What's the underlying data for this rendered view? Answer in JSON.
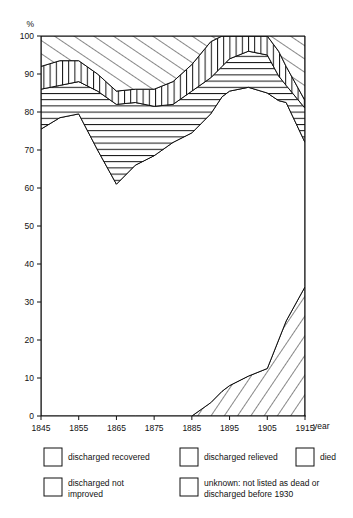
{
  "chart_data": {
    "type": "area",
    "title": "",
    "xlabel": "year",
    "ylabel": "%",
    "ylim": [
      0,
      100
    ],
    "xlim": [
      1845,
      1915
    ],
    "grid": false,
    "legend_position": "bottom",
    "stacked": true,
    "x": [
      1845,
      1850,
      1855,
      1860,
      1865,
      1870,
      1875,
      1880,
      1885,
      1890,
      1893,
      1895,
      1900,
      1905,
      1908,
      1910,
      1915
    ],
    "yticks": [
      0,
      10,
      20,
      30,
      40,
      50,
      60,
      70,
      80,
      90,
      100
    ],
    "xticks": [
      1845,
      1855,
      1865,
      1875,
      1885,
      1895,
      1905,
      1915
    ],
    "series": [
      {
        "name": "unknown: not listed as dead or discharged before 1930",
        "pattern": "diagonal-backslash",
        "order": 1,
        "values": [
          0,
          0,
          0,
          0,
          0,
          0,
          0,
          0,
          0,
          3.5,
          6.5,
          8,
          10.5,
          12.5,
          20,
          25,
          34
        ]
      },
      {
        "name": "died",
        "pattern": "blank",
        "order": 2,
        "values": [
          75.5,
          78.5,
          79.5,
          70,
          61,
          66,
          68.5,
          72,
          74.5,
          76,
          77.5,
          77.5,
          76,
          72.5,
          63,
          57.5,
          38
        ]
      },
      {
        "name": "discharged not improved",
        "pattern": "horizontal",
        "order": 3,
        "values": [
          10.5,
          8.5,
          8.5,
          15.5,
          21,
          16.5,
          13,
          10,
          11,
          9.5,
          8,
          8.5,
          9.5,
          10,
          6.5,
          4.5,
          9
        ]
      },
      {
        "name": "discharged relieved",
        "pattern": "vertical",
        "order": 4,
        "values": [
          6,
          6.5,
          5.5,
          4.5,
          3.5,
          3.5,
          4.5,
          6,
          7,
          9.5,
          10.5,
          11.5,
          11,
          12.5,
          6.5,
          5,
          2
        ]
      },
      {
        "name": "discharged recovered",
        "pattern": "diagonal-slash",
        "order": 5,
        "values": [
          8,
          6.5,
          6.5,
          10,
          14.5,
          14,
          14,
          12,
          7.5,
          5.5,
          4,
          2.5,
          3,
          2.5,
          4,
          8,
          17
        ]
      }
    ],
    "cumulative_boundaries": {
      "unknown_top": [
        0,
        0,
        0,
        0,
        0,
        0,
        0,
        0,
        0,
        3.5,
        6.5,
        8,
        10.5,
        12.5,
        20,
        25,
        34
      ],
      "died_top": [
        75.5,
        78.5,
        79.5,
        70,
        61,
        66,
        68.5,
        72,
        74.5,
        79.5,
        84,
        85.5,
        86.5,
        85,
        83,
        82.5,
        72
      ],
      "notimproved_top": [
        86,
        87,
        88,
        85.5,
        82,
        82.5,
        81.5,
        82,
        85.5,
        89,
        92,
        94,
        96,
        95,
        89.5,
        87,
        81
      ],
      "relieved_top": [
        92,
        93.5,
        93.5,
        90,
        85.5,
        86,
        86,
        88,
        92.5,
        98.5,
        102.5,
        105.5,
        107,
        107.5,
        96,
        92,
        83
      ],
      "recovered_top": [
        100,
        100,
        100,
        100,
        100,
        100,
        100,
        100,
        100,
        100,
        100,
        100,
        100,
        100,
        100,
        100,
        100
      ]
    }
  },
  "axes": {
    "y_axis_unit": "%",
    "x_axis_name": "year",
    "y_tick_labels": [
      "0",
      "10",
      "20",
      "30",
      "40",
      "50",
      "60",
      "70",
      "80",
      "90",
      "100"
    ],
    "x_tick_labels": [
      "1845",
      "1855",
      "1865",
      "1875",
      "1885",
      "1895",
      "1905",
      "1915"
    ]
  },
  "legend": {
    "items": [
      {
        "label": "discharged recovered",
        "pattern": "diagonal-slash"
      },
      {
        "label": "discharged relieved",
        "pattern": "vertical"
      },
      {
        "label": "died",
        "pattern": "blank"
      },
      {
        "label": "discharged not improved",
        "label_line1": "discharged not",
        "label_line2": "improved",
        "pattern": "horizontal"
      },
      {
        "label": "unknown: not listed as dead or discharged before 1930",
        "label_line1": "unknown: not listed as dead or",
        "label_line2": "discharged before 1930",
        "pattern": "diagonal-backslash"
      }
    ]
  },
  "colors": {
    "ink": "#111111",
    "background": "#ffffff"
  }
}
